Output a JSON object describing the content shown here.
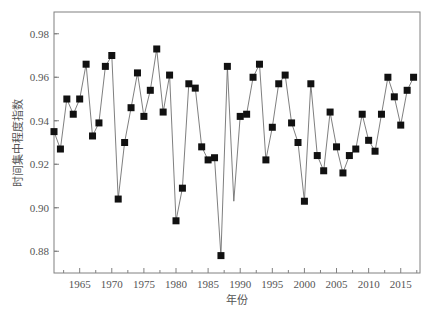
{
  "chart_data": {
    "type": "line",
    "title": "",
    "xlabel": "年份",
    "ylabel": "时间集中程度指数",
    "xlim": [
      1961,
      2018
    ],
    "ylim": [
      0.87,
      0.99
    ],
    "grid": false,
    "legend": null,
    "x_ticks": [
      1965,
      1970,
      1975,
      1980,
      1985,
      1990,
      1995,
      2000,
      2005,
      2010,
      2015
    ],
    "x_tick_labels": [
      "1965",
      "1970",
      "1975",
      "1980",
      "1985",
      "1990",
      "1995",
      "2000",
      "2005",
      "2010",
      "2015"
    ],
    "y_ticks": [
      0.88,
      0.9,
      0.92,
      0.94,
      0.96,
      0.98
    ],
    "y_tick_labels": [
      "0.88",
      "0.90",
      "0.92",
      "0.94",
      "0.96",
      "0.98"
    ],
    "series": [
      {
        "name": "时间集中程度指数",
        "marker": "square",
        "line_color": "#707070",
        "marker_color": "#111111",
        "x": [
          1961,
          1962,
          1963,
          1964,
          1965,
          1966,
          1967,
          1968,
          1969,
          1970,
          1971,
          1972,
          1973,
          1974,
          1975,
          1976,
          1977,
          1978,
          1979,
          1980,
          1981,
          1982,
          1983,
          1984,
          1985,
          1986,
          1987,
          1988,
          1989,
          1990,
          1991,
          1992,
          1993,
          1994,
          1995,
          1996,
          1997,
          1998,
          1999,
          2000,
          2001,
          2002,
          2003,
          2004,
          2005,
          2006,
          2007,
          2008,
          2009,
          2010,
          2011,
          2012,
          2013,
          2014,
          2015,
          2016,
          2017
        ],
        "values": [
          0.935,
          0.927,
          0.95,
          0.943,
          0.95,
          0.966,
          0.933,
          0.939,
          0.965,
          0.97,
          0.904,
          0.93,
          0.946,
          0.962,
          0.942,
          0.954,
          0.973,
          0.944,
          0.961,
          0.894,
          0.909,
          0.957,
          0.955,
          0.928,
          0.922,
          0.923,
          0.878,
          0.965,
          0.903,
          0.942,
          0.943,
          0.96,
          0.966,
          0.922,
          0.937,
          0.957,
          0.961,
          0.939,
          0.93,
          0.903,
          0.957,
          0.924,
          0.917,
          0.944,
          0.928,
          0.916,
          0.924,
          0.927,
          0.943,
          0.931,
          0.926,
          0.943,
          0.96,
          0.951,
          0.938,
          0.954,
          0.96
        ],
        "unmarked_x": [
          1989
        ]
      }
    ]
  }
}
